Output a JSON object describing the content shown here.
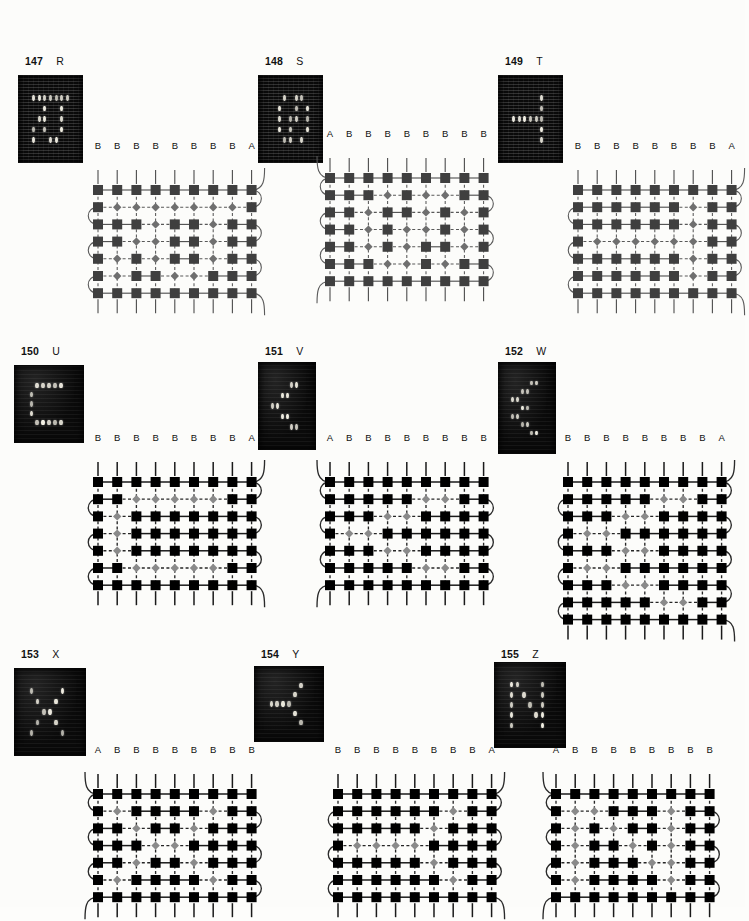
{
  "page": {
    "background": "#fcfcfa",
    "width": 745,
    "height": 907
  },
  "legend": {
    "bead_dark_symbol": "square",
    "bead_light_symbol": "diamond",
    "warp_label_main": "B",
    "warp_label_edge": "A",
    "color_dark": "#3f3f3f",
    "color_light": "#6f6f6f",
    "color_dark_bold": "#000000",
    "color_light_bold": "#8a8a8a"
  },
  "plates": [
    {
      "id": "plate-147",
      "number": "147",
      "letter": "R",
      "style": "thin",
      "headers": [
        "B",
        "B",
        "B",
        "B",
        "B",
        "B",
        "B",
        "B",
        "A"
      ],
      "edge_side": "right",
      "cols": 9,
      "rows": 7,
      "grid": [
        [
          "S",
          "S",
          "S",
          "S",
          "S",
          "S",
          "S",
          "S",
          "S"
        ],
        [
          "S",
          "D",
          "D",
          "D",
          "D",
          "D",
          "D",
          "D",
          "S"
        ],
        [
          "S",
          "S",
          "S",
          "D",
          "S",
          "S",
          "D",
          "S",
          "S"
        ],
        [
          "S",
          "S",
          "D",
          "D",
          "S",
          "S",
          "D",
          "S",
          "S"
        ],
        [
          "S",
          "D",
          "S",
          "D",
          "S",
          "S",
          "D",
          "S",
          "S"
        ],
        [
          "S",
          "D",
          "S",
          "S",
          "D",
          "D",
          "S",
          "S",
          "S"
        ],
        [
          "S",
          "S",
          "S",
          "S",
          "S",
          "S",
          "S",
          "S",
          "S"
        ]
      ]
    },
    {
      "id": "plate-148",
      "number": "148",
      "letter": "S",
      "style": "thin",
      "headers": [
        "A",
        "B",
        "B",
        "B",
        "B",
        "B",
        "B",
        "B",
        "B"
      ],
      "edge_side": "left",
      "cols": 9,
      "rows": 7,
      "grid": [
        [
          "S",
          "S",
          "S",
          "S",
          "S",
          "S",
          "S",
          "S",
          "S"
        ],
        [
          "S",
          "S",
          "S",
          "D",
          "S",
          "D",
          "D",
          "S",
          "S"
        ],
        [
          "S",
          "S",
          "D",
          "S",
          "S",
          "D",
          "S",
          "D",
          "S"
        ],
        [
          "S",
          "S",
          "D",
          "S",
          "D",
          "D",
          "S",
          "D",
          "S"
        ],
        [
          "S",
          "S",
          "D",
          "S",
          "D",
          "S",
          "S",
          "D",
          "S"
        ],
        [
          "S",
          "S",
          "S",
          "D",
          "D",
          "S",
          "D",
          "S",
          "S"
        ],
        [
          "S",
          "S",
          "S",
          "S",
          "S",
          "S",
          "S",
          "S",
          "S"
        ]
      ]
    },
    {
      "id": "plate-149",
      "number": "149",
      "letter": "T",
      "style": "thin",
      "headers": [
        "B",
        "B",
        "B",
        "B",
        "B",
        "B",
        "B",
        "B",
        "A"
      ],
      "edge_side": "right",
      "cols": 9,
      "rows": 7,
      "grid": [
        [
          "S",
          "S",
          "S",
          "S",
          "S",
          "S",
          "S",
          "S",
          "S"
        ],
        [
          "S",
          "S",
          "S",
          "S",
          "S",
          "S",
          "D",
          "S",
          "S"
        ],
        [
          "S",
          "S",
          "S",
          "S",
          "S",
          "S",
          "D",
          "S",
          "S"
        ],
        [
          "S",
          "D",
          "D",
          "D",
          "D",
          "D",
          "D",
          "S",
          "S"
        ],
        [
          "S",
          "S",
          "S",
          "S",
          "S",
          "S",
          "D",
          "S",
          "S"
        ],
        [
          "S",
          "S",
          "S",
          "S",
          "S",
          "S",
          "D",
          "S",
          "S"
        ],
        [
          "S",
          "S",
          "S",
          "S",
          "S",
          "S",
          "S",
          "S",
          "S"
        ]
      ]
    },
    {
      "id": "plate-150",
      "number": "150",
      "letter": "U",
      "style": "bold",
      "headers": [
        "B",
        "B",
        "B",
        "B",
        "B",
        "B",
        "B",
        "B",
        "A"
      ],
      "edge_side": "right",
      "cols": 9,
      "rows": 7,
      "grid": [
        [
          "S",
          "S",
          "S",
          "S",
          "S",
          "S",
          "S",
          "S",
          "S"
        ],
        [
          "S",
          "S",
          "D",
          "D",
          "D",
          "D",
          "D",
          "S",
          "S"
        ],
        [
          "S",
          "D",
          "S",
          "S",
          "S",
          "S",
          "S",
          "S",
          "S"
        ],
        [
          "S",
          "D",
          "S",
          "S",
          "S",
          "S",
          "S",
          "S",
          "S"
        ],
        [
          "S",
          "D",
          "S",
          "S",
          "S",
          "S",
          "S",
          "S",
          "S"
        ],
        [
          "S",
          "S",
          "D",
          "D",
          "D",
          "D",
          "D",
          "S",
          "S"
        ],
        [
          "S",
          "S",
          "S",
          "S",
          "S",
          "S",
          "S",
          "S",
          "S"
        ]
      ]
    },
    {
      "id": "plate-151",
      "number": "151",
      "letter": "V",
      "style": "bold",
      "headers": [
        "A",
        "B",
        "B",
        "B",
        "B",
        "B",
        "B",
        "B",
        "B"
      ],
      "edge_side": "left",
      "cols": 9,
      "rows": 7,
      "grid": [
        [
          "S",
          "S",
          "S",
          "S",
          "S",
          "S",
          "S",
          "S",
          "S"
        ],
        [
          "S",
          "S",
          "S",
          "S",
          "S",
          "D",
          "D",
          "S",
          "S"
        ],
        [
          "S",
          "S",
          "S",
          "D",
          "D",
          "S",
          "S",
          "S",
          "S"
        ],
        [
          "S",
          "D",
          "D",
          "S",
          "S",
          "S",
          "S",
          "S",
          "S"
        ],
        [
          "S",
          "S",
          "S",
          "D",
          "D",
          "S",
          "S",
          "S",
          "S"
        ],
        [
          "S",
          "S",
          "S",
          "S",
          "S",
          "D",
          "D",
          "S",
          "S"
        ],
        [
          "S",
          "S",
          "S",
          "S",
          "S",
          "S",
          "S",
          "S",
          "S"
        ]
      ]
    },
    {
      "id": "plate-152",
      "number": "152",
      "letter": "W",
      "style": "bold",
      "headers": [
        "B",
        "B",
        "B",
        "B",
        "B",
        "B",
        "B",
        "B",
        "A"
      ],
      "edge_side": "right",
      "cols": 9,
      "rows": 9,
      "grid": [
        [
          "S",
          "S",
          "S",
          "S",
          "S",
          "S",
          "S",
          "S",
          "S"
        ],
        [
          "S",
          "S",
          "S",
          "S",
          "S",
          "D",
          "D",
          "S",
          "S"
        ],
        [
          "S",
          "S",
          "S",
          "D",
          "D",
          "S",
          "S",
          "S",
          "S"
        ],
        [
          "S",
          "D",
          "D",
          "S",
          "S",
          "S",
          "S",
          "S",
          "S"
        ],
        [
          "S",
          "S",
          "S",
          "D",
          "D",
          "S",
          "S",
          "S",
          "S"
        ],
        [
          "S",
          "D",
          "D",
          "S",
          "S",
          "S",
          "S",
          "S",
          "S"
        ],
        [
          "S",
          "S",
          "S",
          "D",
          "D",
          "S",
          "S",
          "S",
          "S"
        ],
        [
          "S",
          "S",
          "S",
          "S",
          "S",
          "D",
          "D",
          "S",
          "S"
        ],
        [
          "S",
          "S",
          "S",
          "S",
          "S",
          "S",
          "S",
          "S",
          "S"
        ]
      ]
    },
    {
      "id": "plate-153",
      "number": "153",
      "letter": "X",
      "style": "bold",
      "headers": [
        "A",
        "B",
        "B",
        "B",
        "B",
        "B",
        "B",
        "B",
        "B"
      ],
      "edge_side": "left",
      "cols": 9,
      "rows": 7,
      "grid": [
        [
          "S",
          "S",
          "S",
          "S",
          "S",
          "S",
          "S",
          "S",
          "S"
        ],
        [
          "S",
          "D",
          "S",
          "S",
          "S",
          "S",
          "D",
          "S",
          "S"
        ],
        [
          "S",
          "S",
          "D",
          "S",
          "S",
          "D",
          "S",
          "S",
          "S"
        ],
        [
          "S",
          "S",
          "S",
          "D",
          "D",
          "S",
          "S",
          "S",
          "S"
        ],
        [
          "S",
          "S",
          "D",
          "S",
          "S",
          "D",
          "S",
          "S",
          "S"
        ],
        [
          "S",
          "D",
          "S",
          "S",
          "S",
          "S",
          "D",
          "S",
          "S"
        ],
        [
          "S",
          "S",
          "S",
          "S",
          "S",
          "S",
          "S",
          "S",
          "S"
        ]
      ]
    },
    {
      "id": "plate-154",
      "number": "154",
      "letter": "Y",
      "style": "bold",
      "headers": [
        "B",
        "B",
        "B",
        "B",
        "B",
        "B",
        "B",
        "B",
        "A"
      ],
      "edge_side": "right",
      "cols": 9,
      "rows": 7,
      "grid": [
        [
          "S",
          "S",
          "S",
          "S",
          "S",
          "S",
          "S",
          "S",
          "S"
        ],
        [
          "S",
          "S",
          "S",
          "S",
          "S",
          "S",
          "D",
          "S",
          "S"
        ],
        [
          "S",
          "S",
          "S",
          "S",
          "S",
          "D",
          "S",
          "S",
          "S"
        ],
        [
          "S",
          "D",
          "D",
          "D",
          "D",
          "S",
          "S",
          "S",
          "S"
        ],
        [
          "S",
          "S",
          "S",
          "S",
          "S",
          "D",
          "S",
          "S",
          "S"
        ],
        [
          "S",
          "S",
          "S",
          "S",
          "S",
          "S",
          "D",
          "S",
          "S"
        ],
        [
          "S",
          "S",
          "S",
          "S",
          "S",
          "S",
          "S",
          "S",
          "S"
        ]
      ]
    },
    {
      "id": "plate-155",
      "number": "155",
      "letter": "Z",
      "style": "bold",
      "headers": [
        "A",
        "B",
        "B",
        "B",
        "B",
        "B",
        "B",
        "B",
        "B"
      ],
      "edge_side": "left",
      "cols": 9,
      "rows": 7,
      "grid": [
        [
          "S",
          "S",
          "S",
          "S",
          "S",
          "S",
          "S",
          "S",
          "S"
        ],
        [
          "S",
          "D",
          "D",
          "S",
          "S",
          "S",
          "D",
          "S",
          "S"
        ],
        [
          "S",
          "D",
          "S",
          "D",
          "S",
          "S",
          "D",
          "S",
          "S"
        ],
        [
          "S",
          "D",
          "S",
          "S",
          "D",
          "S",
          "D",
          "S",
          "S"
        ],
        [
          "S",
          "D",
          "S",
          "S",
          "S",
          "D",
          "D",
          "S",
          "S"
        ],
        [
          "S",
          "D",
          "S",
          "S",
          "S",
          "S",
          "D",
          "S",
          "S"
        ],
        [
          "S",
          "S",
          "S",
          "S",
          "S",
          "S",
          "S",
          "S",
          "S"
        ]
      ]
    }
  ]
}
